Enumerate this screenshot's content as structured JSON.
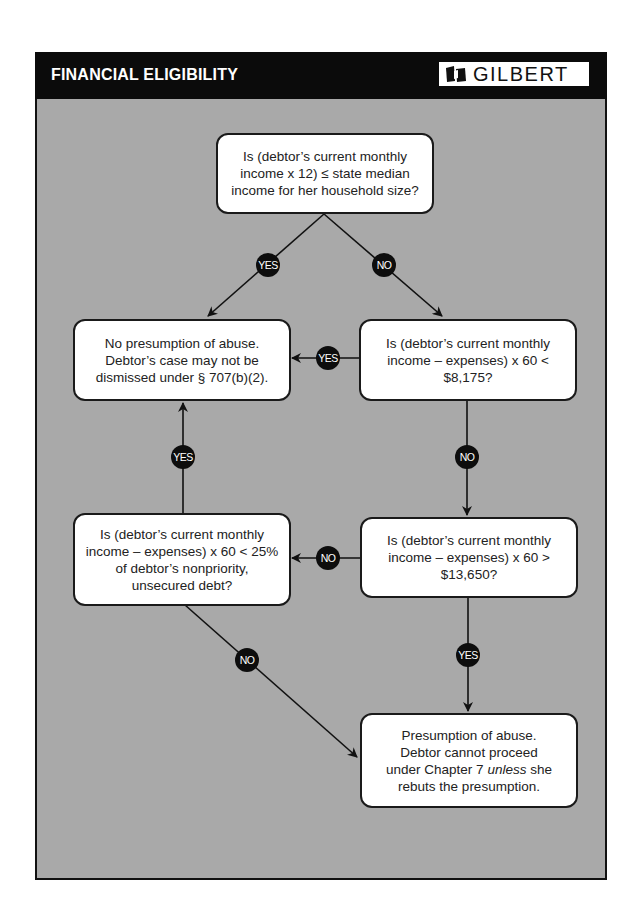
{
  "header": {
    "title": "FINANCIAL ELIGIBILITY",
    "logo_text": "GILBERT",
    "logo_icon": "book-icon"
  },
  "colors": {
    "panel_bg": "#a9a9a9",
    "header_bg": "#0b0b0b",
    "node_bg": "#ffffff",
    "badge_bg": "#0d0d0d"
  },
  "nodes": {
    "q_median": "Is (debtor’s current monthly income x 12) ≤ state median income for her household size?",
    "no_presumption": "No presumption of abuse. Debtor’s case may not be dismissed under § 707(b)(2).",
    "q_8175": "Is (debtor’s current monthly income – expenses) x 60 < $8,175?",
    "q_25pct": "Is (debtor’s current monthly income – expenses) x 60 < 25% of debtor’s nonpriority, unsecured debt?",
    "q_13650": "Is (debtor’s current monthly income – expenses) x 60 > $13,650?",
    "presumption_pre": "Presumption of  abuse. Debtor cannot proceed under Chapter 7 ",
    "presumption_em": "unless",
    "presumption_post": " she rebuts the presumption."
  },
  "edges": [
    {
      "from": "q_median",
      "to": "no_presumption",
      "label": "YES"
    },
    {
      "from": "q_median",
      "to": "q_8175",
      "label": "NO"
    },
    {
      "from": "q_8175",
      "to": "no_presumption",
      "label": "YES"
    },
    {
      "from": "q_8175",
      "to": "q_13650",
      "label": "NO"
    },
    {
      "from": "q_13650",
      "to": "q_25pct",
      "label": "NO"
    },
    {
      "from": "q_13650",
      "to": "presumption",
      "label": "YES"
    },
    {
      "from": "q_25pct",
      "to": "no_presumption",
      "label": "YES"
    },
    {
      "from": "q_25pct",
      "to": "presumption",
      "label": "NO"
    }
  ]
}
